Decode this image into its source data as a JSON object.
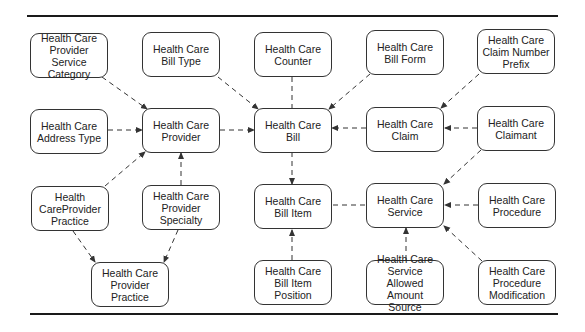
{
  "diagram": {
    "type": "entity-relationship",
    "nodes": [
      {
        "id": "n1",
        "label": "Health Care Provider Service Category"
      },
      {
        "id": "n2",
        "label": "Health Care Bill Type"
      },
      {
        "id": "n3",
        "label": "Health Care Counter"
      },
      {
        "id": "n4",
        "label": "Health Care Bill Form"
      },
      {
        "id": "n5",
        "label": "Health Care Claim Number Prefix"
      },
      {
        "id": "n6",
        "label": "Health Care Address Type"
      },
      {
        "id": "n7",
        "label": "Health Care Provider"
      },
      {
        "id": "n8",
        "label": "Health Care Bill"
      },
      {
        "id": "n9",
        "label": "Health Care Claim"
      },
      {
        "id": "n10",
        "label": "Health Care Claimant"
      },
      {
        "id": "n11",
        "label": "Health CareProvider Practice"
      },
      {
        "id": "n12",
        "label": "Health Care Provider Specialty"
      },
      {
        "id": "n13",
        "label": "Health Care Bill Item"
      },
      {
        "id": "n14",
        "label": "Health Care Service"
      },
      {
        "id": "n15",
        "label": "Health Care Procedure"
      },
      {
        "id": "n16",
        "label": "Health Care Provider Practice"
      },
      {
        "id": "n17",
        "label": "Health Care Bill Item Position"
      },
      {
        "id": "n18",
        "label": "Health Care Service Allowed Amount Source"
      },
      {
        "id": "n19",
        "label": "Health Care Procedure Modification"
      }
    ],
    "edges": [
      {
        "from": "Health Care Provider Service Category",
        "to": "Health Care Provider",
        "arrow": true
      },
      {
        "from": "Health Care Address Type",
        "to": "Health Care Provider",
        "arrow": true
      },
      {
        "from": "Health CareProvider Practice",
        "to": "Health Care Provider",
        "arrow": true
      },
      {
        "from": "Health Care Provider Specialty",
        "to": "Health Care Provider",
        "arrow": true
      },
      {
        "from": "Health CareProvider Practice",
        "to": "Health Care Provider Practice",
        "arrow": true
      },
      {
        "from": "Health Care Provider Specialty",
        "to": "Health Care Provider Practice",
        "arrow": true
      },
      {
        "from": "Health Care Provider",
        "to": "Health Care Bill",
        "arrow": true
      },
      {
        "from": "Health Care Bill Type",
        "to": "Health Care Bill",
        "arrow": true
      },
      {
        "from": "Health Care Counter",
        "to": "Health Care Bill",
        "arrow": false
      },
      {
        "from": "Health Care Bill Form",
        "to": "Health Care Bill",
        "arrow": true
      },
      {
        "from": "Health Care Claim",
        "to": "Health Care Bill",
        "arrow": true
      },
      {
        "from": "Health Care Claim Number Prefix",
        "to": "Health Care Claim",
        "arrow": true
      },
      {
        "from": "Health Care Claimant",
        "to": "Health Care Claim",
        "arrow": true
      },
      {
        "from": "Health Care Bill",
        "to": "Health Care Bill Item",
        "arrow": true
      },
      {
        "from": "Health Care Bill Item Position",
        "to": "Health Care Bill Item",
        "arrow": true
      },
      {
        "from": "Health Care Service",
        "to": "Health Care Bill Item",
        "arrow": false
      },
      {
        "from": "Health Care Claimant",
        "to": "Health Care Service",
        "arrow": true
      },
      {
        "from": "Health Care Procedure",
        "to": "Health Care Service",
        "arrow": true
      },
      {
        "from": "Health Care Service Allowed Amount Source",
        "to": "Health Care Service",
        "arrow": true
      },
      {
        "from": "Health Care Procedure Modification",
        "to": "Health Care Service",
        "arrow": true
      }
    ]
  }
}
